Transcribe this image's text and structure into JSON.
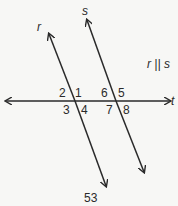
{
  "diagram": {
    "lines": {
      "r": "r",
      "s": "s",
      "t": "t"
    },
    "relation": "r || s",
    "angles": [
      "1",
      "2",
      "3",
      "4",
      "5",
      "6",
      "7",
      "8"
    ],
    "caption": "53",
    "stroke_color": "#2a2a2a"
  }
}
